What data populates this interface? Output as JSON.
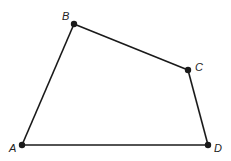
{
  "diagram": {
    "type": "quadrilateral",
    "points": [
      {
        "label": "A",
        "x": 22,
        "y": 145,
        "lx": 9,
        "ly": 152
      },
      {
        "label": "B",
        "x": 74,
        "y": 24,
        "lx": 62,
        "ly": 20
      },
      {
        "label": "C",
        "x": 188,
        "y": 70,
        "lx": 195,
        "ly": 71
      },
      {
        "label": "D",
        "x": 208,
        "y": 145,
        "lx": 214,
        "ly": 152
      }
    ],
    "edges": [
      [
        "A",
        "B"
      ],
      [
        "B",
        "C"
      ],
      [
        "C",
        "D"
      ],
      [
        "D",
        "A"
      ]
    ],
    "stroke_color": "#1a1a1a"
  }
}
